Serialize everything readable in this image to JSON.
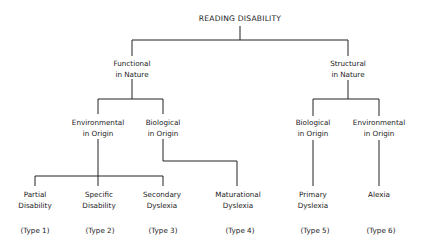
{
  "root": {
    "label": "READING DISABILITY"
  },
  "branches": {
    "functional": {
      "line1": "Functional",
      "line2": "in Nature"
    },
    "structural": {
      "line1": "Structural",
      "line2": "in Nature"
    }
  },
  "origins": {
    "func_env": {
      "line1": "Environmental",
      "line2": "in Origin"
    },
    "func_bio": {
      "line1": "Biological",
      "line2": "in Origin"
    },
    "struct_bio": {
      "line1": "Biological",
      "line2": "in Origin"
    },
    "struct_env": {
      "line1": "Environmental",
      "line2": "in Origin"
    }
  },
  "leaves": [
    {
      "line1": "Partial",
      "line2": "Disability",
      "type": "(Type 1)"
    },
    {
      "line1": "Specific",
      "line2": "Disability",
      "type": "(Type 2)"
    },
    {
      "line1": "Secondary",
      "line2": "Dyslexia",
      "type": "(Type 3)"
    },
    {
      "line1": "Maturational",
      "line2": "Dyslexia",
      "type": "(Type 4)"
    },
    {
      "line1": "Primary",
      "line2": "Dyslexia",
      "type": "(Type 5)"
    },
    {
      "line1": "Alexia",
      "line2": "",
      "type": "(Type 6)"
    }
  ]
}
